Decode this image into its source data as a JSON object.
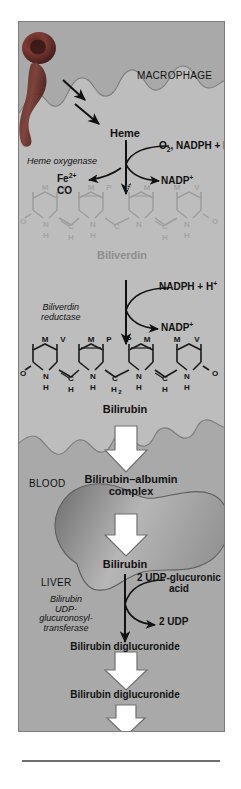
{
  "figure": {
    "compartments": {
      "macrophage": "MACROPHAGE",
      "blood": "BLOOD",
      "liver": "LIVER",
      "bile": "BILE"
    },
    "metabolites": {
      "heme": "Heme",
      "biliverdin": "Biliverdin",
      "bilirubin": "Bilirubin",
      "bilirubin2": "Bilirubin",
      "bilirubin_albumin": "Bilirubin–albumin complex",
      "bilirubin_liver": "Bilirubin",
      "bilirubin_diglucuronide": "Bilirubin diglucuronide",
      "bilirubin_diglucuronide2": "Bilirubin diglucuronide"
    },
    "enzymes": {
      "heme_oxygenase": "Heme oxygenase",
      "biliverdin_reductase_l1": "Biliverdin",
      "biliverdin_reductase_l2": "reductase",
      "ugt_l1": "Bilirubin",
      "ugt_l2": "UDP-",
      "ugt_l3": "glucuronosyl-",
      "ugt_l4": "transferase"
    },
    "cosubstrates": {
      "o2_nadph_h": "O2, NADPH + H+",
      "nadp_plus_1": "NADP+",
      "nadph_h_2": "NADPH + H+",
      "nadp_plus_2": "NADP+",
      "fe2": "Fe2+",
      "co": "CO",
      "udp_glucuronic_l1": "2 UDP-glucuronic",
      "udp_glucuronic_l2": "acid",
      "udp": "2 UDP"
    },
    "structures": {
      "biliverdin": {
        "name": "Biliverdin",
        "color": "#a5a5a5",
        "ring_substituents": [
          "M",
          "V",
          "M",
          "P",
          "P",
          "M",
          "M",
          "V"
        ],
        "terminal_oxygens": [
          "O",
          "O"
        ],
        "ring_nitrogens": [
          "N",
          "N",
          "N",
          "N"
        ],
        "nh_hydrogens": [
          "H",
          "H",
          "H"
        ],
        "bridge_carbons": [
          "C",
          "C",
          "C"
        ],
        "bridge_hydrogens": [
          "H",
          "H",
          "H"
        ],
        "center_bridge": "C"
      },
      "bilirubin": {
        "name": "Bilirubin",
        "color": "#1b1b1b",
        "ring_substituents": [
          "M",
          "V",
          "M",
          "P",
          "P",
          "M",
          "M",
          "V"
        ],
        "terminal_oxygens": [
          "O",
          "O"
        ],
        "ring_nitrogens": [
          "N",
          "N",
          "N",
          "N"
        ],
        "nh_hydrogens": [
          "H",
          "H",
          "H",
          "H"
        ],
        "bridge_carbons": [
          "C",
          "C",
          "C"
        ],
        "bridge_hydrogens": [
          "H",
          "H"
        ],
        "center_bridge": "C",
        "center_bridge_sub": "2"
      }
    },
    "cells": {
      "erythrocyte": "erythrocyte"
    },
    "colors": {
      "panel_background": "#a9a9a9",
      "macrophage_fill": "#bdbdbd",
      "liver_fill": "#9a9a9a",
      "erythrocyte": "#7d3a33",
      "block_arrow_fill": "#ffffff",
      "block_arrow_stroke": "#6e6e6e",
      "gray_text": "#8e8e8e",
      "black_text": "#111111"
    }
  }
}
